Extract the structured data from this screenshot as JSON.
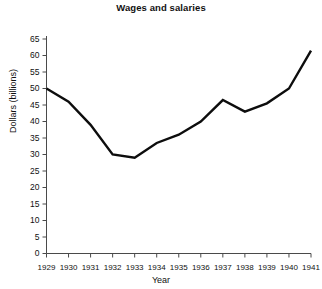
{
  "chart_data": {
    "type": "line",
    "title": "Wages and salaries",
    "xlabel": "Year",
    "ylabel": "Dollars (billions)",
    "categories": [
      "1929",
      "1930",
      "1931",
      "1932",
      "1933",
      "1934",
      "1935",
      "1936",
      "1937",
      "1938",
      "1939",
      "1940",
      "1941"
    ],
    "values": [
      50,
      46,
      39,
      30,
      29,
      33.5,
      36,
      40,
      46.5,
      43,
      45.5,
      50,
      61.5
    ],
    "series": [
      {
        "name": "Wages and salaries",
        "values": [
          50,
          46,
          39,
          30,
          29,
          33.5,
          36,
          40,
          46.5,
          43,
          45.5,
          50,
          61.5
        ]
      }
    ],
    "ylim": [
      0,
      65
    ],
    "ytick_labels": [
      "0",
      "5",
      "10",
      "15",
      "20",
      "25",
      "30",
      "35",
      "40",
      "45",
      "50",
      "55",
      "60",
      "65"
    ],
    "ytick_values": [
      0,
      5,
      10,
      15,
      20,
      25,
      30,
      35,
      40,
      45,
      50,
      55,
      60,
      65
    ],
    "xtick_labels": [
      "1929",
      "1930",
      "1931",
      "1932",
      "1933",
      "1934",
      "1935",
      "1936",
      "1937",
      "1938",
      "1939",
      "1940",
      "1941"
    ],
    "grid": false,
    "legend": "none",
    "line_color": "#0d0d0d",
    "axis_color": "#4a4a4a"
  }
}
